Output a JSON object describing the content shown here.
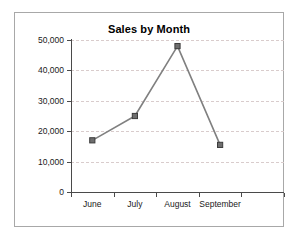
{
  "chart_data": {
    "type": "line",
    "title": "Sales by Month",
    "xlabel": "",
    "ylabel": "",
    "categories": [
      "June",
      "July",
      "August",
      "September"
    ],
    "values": [
      17000,
      25000,
      48000,
      15500
    ],
    "series": [
      {
        "name": "Sales",
        "values": [
          17000,
          25000,
          48000,
          15500
        ]
      }
    ],
    "ylim": [
      0,
      50000
    ],
    "ytick_values": [
      0,
      10000,
      20000,
      30000,
      40000,
      50000
    ],
    "ytick_labels": [
      "0",
      "10,000",
      "20,000",
      "30,000",
      "40,000",
      "50,000"
    ],
    "grid": true,
    "grid_axis": "y",
    "legend": false,
    "legend_position": "none",
    "marker": "square",
    "colors": {
      "line": "#808080",
      "marker_fill": "#6e6e6e",
      "marker_edge": "#3c3c3c",
      "gridline": "#d9cccc",
      "axis": "#4a4a4a",
      "border": "#a8a8a8",
      "background": "#ffffff",
      "text": "#1a1a1a"
    }
  }
}
